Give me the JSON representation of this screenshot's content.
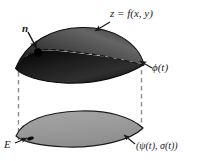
{
  "figure": {
    "name": "surface-over-region-diagram",
    "type": "mathematical-diagram",
    "width": 201,
    "height": 161,
    "background_color": "#ffffff"
  },
  "labels": {
    "surface_equation": "z = f(x, y)",
    "normal_vector": "n",
    "boundary_curve_upper": "ϕ(t)",
    "region": "E",
    "boundary_curve_lower": "(ψ(t), σ(t))"
  },
  "colors": {
    "surface_dark": "#2b2b2b",
    "surface_mid": "#4f4f4f",
    "surface_highlight": "#7c7c7c",
    "surface_shadow": "#0d0d0d",
    "region_fill": "#9a9a9a",
    "region_edge": "#1a1a1a",
    "dashed_line": "#8e8e8e",
    "text": "#1a1a1a",
    "arrow": "#1a1a1a",
    "point_marker": "#000000"
  },
  "elements": {
    "upper_surface_name": "curved-surface",
    "lower_region_name": "planar-region",
    "dashed_curve_name": "hidden-boundary-curve",
    "left_connector_name": "left-projection-line",
    "right_connector_name": "right-projection-line",
    "normal_point_name": "normal-base-point",
    "region_point_name": "region-interior-point"
  }
}
